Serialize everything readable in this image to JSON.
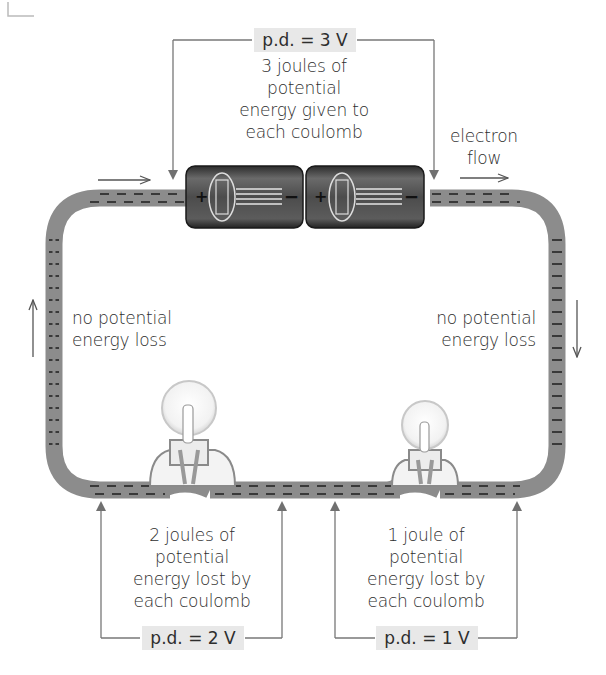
{
  "diagram": {
    "colors": {
      "wire": "#8a8a8a",
      "wire_dash": "#1e1e1e",
      "annotation_line": "#777777",
      "pd_box": "#e8e8e8",
      "battery": "#4a4a4a"
    },
    "battery_label": {
      "pd": "p.d. = 3 V",
      "lines": [
        "3 joules of",
        "potential",
        "energy given to",
        "each coulomb"
      ]
    },
    "electron_flow": {
      "lines": [
        "electron",
        "flow"
      ]
    },
    "left_side": {
      "lines": [
        "no potential",
        "energy loss"
      ]
    },
    "right_side": {
      "lines": [
        "no potential",
        "energy loss"
      ]
    },
    "lamp_1": {
      "pd": "p.d. = 2 V",
      "lines": [
        "2 joules of",
        "potential",
        "energy lost by",
        "each coulomb"
      ]
    },
    "lamp_2": {
      "pd": "p.d. = 1 V",
      "lines": [
        "1 joule of",
        "potential",
        "energy lost by",
        "each coulomb"
      ]
    },
    "cells": [
      {
        "positive": "+",
        "negative": "−"
      },
      {
        "positive": "+",
        "negative": "−"
      }
    ]
  }
}
